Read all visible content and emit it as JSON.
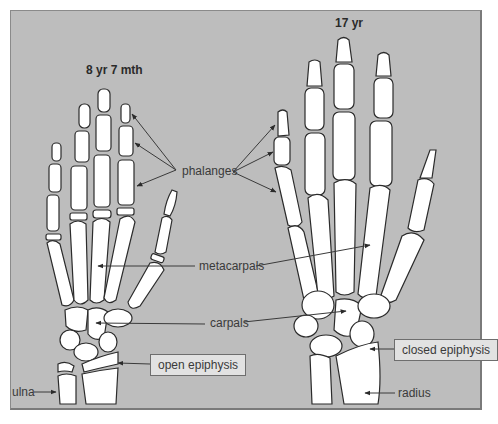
{
  "figure": {
    "background_color": "#bdbdbd",
    "bone_color": "#ffffff",
    "outline_color": "#2b2b2b"
  },
  "left_hand": {
    "title": "8 yr 7 mth",
    "labels": {
      "ulna": "ulna",
      "open_epiphysis": "open epiphysis"
    }
  },
  "right_hand": {
    "title": "17 yr",
    "labels": {
      "closed_epiphysis": "closed epiphysis",
      "radius": "radius"
    }
  },
  "shared_labels": {
    "phalanges": "phalanges",
    "metacarpals": "metacarpals",
    "carpals": "carpals"
  }
}
